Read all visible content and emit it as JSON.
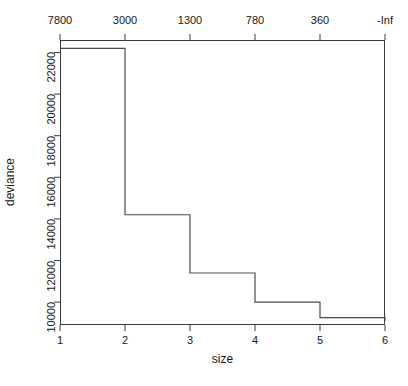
{
  "chart_data": {
    "type": "line",
    "subtype": "step",
    "title": "",
    "xlabel": "size",
    "ylabel": "deviance",
    "x": [
      1,
      2,
      3,
      4,
      5,
      6
    ],
    "values": [
      22200,
      14200,
      11400,
      10000,
      9250,
      9100
    ],
    "series": [
      {
        "name": "deviance",
        "values": [
          22200,
          14200,
          11400,
          10000,
          9250,
          9100
        ]
      }
    ],
    "xlim": [
      1,
      6
    ],
    "ylim": [
      8900,
      22600
    ],
    "grid": false,
    "legend": false,
    "legend_position": "none",
    "x_ticks": [
      "1",
      "2",
      "3",
      "4",
      "5",
      "6"
    ],
    "x_tick_values": [
      1,
      2,
      3,
      4,
      5,
      6
    ],
    "y_ticks": [
      "10000",
      "12000",
      "14000",
      "16000",
      "18000",
      "20000",
      "22000"
    ],
    "y_tick_values": [
      10000,
      12000,
      14000,
      16000,
      18000,
      20000,
      22000
    ],
    "top_axis_label": "",
    "top_ticks": [
      "7800",
      "3000",
      "1300",
      "780",
      "360",
      "-Inf"
    ],
    "top_tick_x_values": [
      1,
      2,
      3,
      4,
      5,
      6
    ],
    "line_color": "#4a4a4a",
    "axis_color": "#3a3a3a",
    "background_color": "#ffffff"
  }
}
